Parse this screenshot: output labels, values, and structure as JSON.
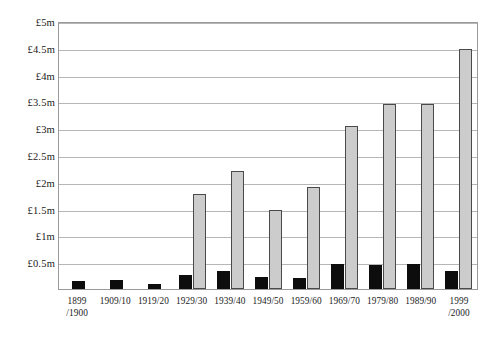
{
  "chart_data": {
    "type": "bar",
    "title": "",
    "subtitle": "",
    "xlabel": "",
    "ylabel": "",
    "ylim": [
      0,
      5
    ],
    "yunit": "£m",
    "grid": true,
    "legend": "none",
    "categories": [
      "1899/1900",
      "1909/10",
      "1919/20",
      "1929/30",
      "1939/40",
      "1949/50",
      "1959/60",
      "1969/70",
      "1979/80",
      "1989/90",
      "1999/2000"
    ],
    "category_lines": [
      [
        "1899",
        "/1900"
      ],
      [
        "1909/10",
        ""
      ],
      [
        "1919/20",
        ""
      ],
      [
        "1929/30",
        ""
      ],
      [
        "1939/40",
        ""
      ],
      [
        "1949/50",
        ""
      ],
      [
        "1959/60",
        ""
      ],
      [
        "1969/70",
        ""
      ],
      [
        "1979/80",
        ""
      ],
      [
        "1989/90",
        ""
      ],
      [
        "1999",
        "/2000"
      ]
    ],
    "ytick_labels": [
      "£5m",
      "£4.5m",
      "£4m",
      "£3.5m",
      "£3m",
      "£2.5m",
      "£2m",
      "£1.5m",
      "£1m",
      "£0.5m"
    ],
    "ytick_values": [
      5,
      4.5,
      4,
      3.5,
      3,
      2.5,
      2,
      1.5,
      1,
      0.5
    ],
    "series": [
      {
        "name": "series-a",
        "color": "#0d0d0d",
        "values": [
          0.15,
          0.17,
          0.09,
          0.26,
          0.33,
          0.22,
          0.21,
          0.46,
          0.44,
          0.46,
          0.33
        ]
      },
      {
        "name": "series-b",
        "color": "#cccccc",
        "values": [
          0,
          0,
          0,
          1.77,
          2.2,
          1.47,
          1.9,
          3.05,
          3.45,
          3.45,
          4.47
        ]
      }
    ]
  }
}
